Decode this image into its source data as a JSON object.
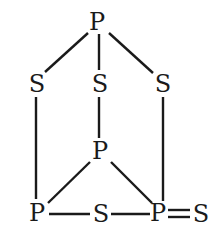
{
  "diagram": {
    "type": "chemical-structure",
    "colors": {
      "background": "#ffffff",
      "ink": "#1a1a1a"
    },
    "atoms": [
      {
        "id": "P1",
        "label": "P",
        "x": 97,
        "y": 22
      },
      {
        "id": "S1",
        "label": "S",
        "x": 37,
        "y": 83
      },
      {
        "id": "S2",
        "label": "S",
        "x": 100,
        "y": 83
      },
      {
        "id": "S3",
        "label": "S",
        "x": 163,
        "y": 83
      },
      {
        "id": "P2",
        "label": "P",
        "x": 100,
        "y": 151
      },
      {
        "id": "P3",
        "label": "P",
        "x": 37,
        "y": 213
      },
      {
        "id": "S4",
        "label": "S",
        "x": 101,
        "y": 213
      },
      {
        "id": "P4",
        "label": "P",
        "x": 158,
        "y": 213
      },
      {
        "id": "S5",
        "label": "S",
        "x": 200,
        "y": 213
      }
    ],
    "bonds": [
      {
        "from": "P1",
        "to": "S1",
        "order": 1
      },
      {
        "from": "P1",
        "to": "S2",
        "order": 1
      },
      {
        "from": "P1",
        "to": "S3",
        "order": 1
      },
      {
        "from": "S1",
        "to": "P3",
        "order": 1
      },
      {
        "from": "S2",
        "to": "P2",
        "order": 1
      },
      {
        "from": "S3",
        "to": "P4",
        "order": 1
      },
      {
        "from": "P2",
        "to": "P3",
        "order": 1
      },
      {
        "from": "P2",
        "to": "P4",
        "order": 1
      },
      {
        "from": "P3",
        "to": "S4",
        "order": 1
      },
      {
        "from": "S4",
        "to": "P4",
        "order": 1
      },
      {
        "from": "P4",
        "to": "S5",
        "order": 2
      }
    ]
  }
}
